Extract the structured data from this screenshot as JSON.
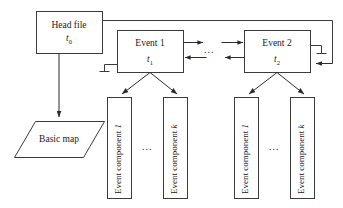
{
  "diagram": {
    "stroke_color": "#3a3a3a",
    "text_color": "#1a1a1a",
    "background": "#ffffff",
    "nodes": {
      "head_file": {
        "label": "Head file",
        "time_symbol": "t",
        "time_index": "0"
      },
      "basic_map": {
        "label": "Basic map"
      },
      "event1": {
        "label": "Event 1",
        "time_symbol": "t",
        "time_index": "1"
      },
      "event2": {
        "label": "Event 2",
        "time_symbol": "t",
        "time_index": "2"
      }
    },
    "components": {
      "group1": {
        "first": {
          "prefix": "Event component ",
          "index": "1"
        },
        "last": {
          "prefix": "Event component ",
          "index": "k"
        },
        "ellipsis": "..."
      },
      "group2": {
        "first": {
          "prefix": "Event component ",
          "index": "1"
        },
        "last": {
          "prefix": "Event component ",
          "index": "k"
        },
        "ellipsis": "..."
      }
    },
    "connectors": {
      "between_events_ellipsis": "...",
      "forward_arrow_name": "event1-to-event2-arrow",
      "backward_arrow_name": "event2-to-event1-arrow"
    }
  }
}
